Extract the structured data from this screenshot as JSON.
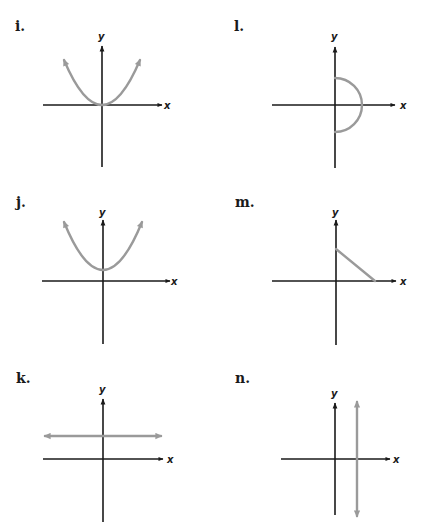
{
  "panels": [
    {
      "id": "i",
      "label": "i.",
      "x_axis_label": "x",
      "y_axis_label": "y",
      "description": "upward parabola with vertex at origin, arrows at both ends"
    },
    {
      "id": "l",
      "label": "l.",
      "x_axis_label": "x",
      "y_axis_label": "y",
      "description": "right semicircle centered at origin"
    },
    {
      "id": "j",
      "label": "j.",
      "x_axis_label": "x",
      "y_axis_label": "y",
      "description": "upward parabola with vertex above origin on y-axis, arrows at both ends"
    },
    {
      "id": "m",
      "label": "m.",
      "x_axis_label": "x",
      "y_axis_label": "y",
      "description": "line segment from positive y-axis to positive x-axis"
    },
    {
      "id": "k",
      "label": "k.",
      "x_axis_label": "x",
      "y_axis_label": "y",
      "description": "horizontal line above x-axis, arrows at both ends"
    },
    {
      "id": "n",
      "label": "n.",
      "x_axis_label": "x",
      "y_axis_label": "y",
      "description": "vertical line right of y-axis, arrows at both ends"
    }
  ],
  "colors": {
    "axis": "#1a1a1a",
    "curve": "#9a9a9a",
    "background": "#ffffff"
  }
}
